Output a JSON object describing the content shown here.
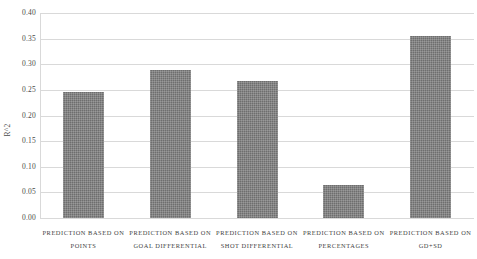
{
  "chart_data": {
    "type": "bar",
    "title": "",
    "xlabel": "",
    "ylabel": "R^2",
    "ylim": [
      0.0,
      0.4
    ],
    "grid": true,
    "legend": "none",
    "yticks": [
      "0.40",
      "0.35",
      "0.30",
      "0.25",
      "0.20",
      "0.15",
      "0.10",
      "0.05",
      "0.00"
    ],
    "ytick_values": [
      0.4,
      0.35,
      0.3,
      0.25,
      0.2,
      0.15,
      0.1,
      0.05,
      0.0
    ],
    "categories": [
      "PREDICTION BASED ON POINTS",
      "PREDICTION BASED ON GOAL DIFFERENTIAL",
      "PREDICTION BASED ON SHOT DIFFERENTIAL",
      "PREDICTION BASED ON PERCENTAGES",
      "PREDICTION BASED ON GD+SD"
    ],
    "category_lines": [
      {
        "line1": "PREDICTION BASED ON",
        "line2": "POINTS"
      },
      {
        "line1": "PREDICTION BASED ON",
        "line2": "GOAL DIFFERENTIAL"
      },
      {
        "line1": "PREDICTION BASED ON",
        "line2": "SHOT DIFFERENTIAL"
      },
      {
        "line1": "PREDICTION BASED ON",
        "line2": "PERCENTAGES"
      },
      {
        "line1": "PREDICTION BASED ON",
        "line2": "GD+SD"
      }
    ],
    "values": [
      0.245,
      0.289,
      0.268,
      0.065,
      0.356
    ],
    "bar_color": "#6e6e6e",
    "gridline_color": "#d9d9d9",
    "text_color": "#4a4a4a"
  }
}
